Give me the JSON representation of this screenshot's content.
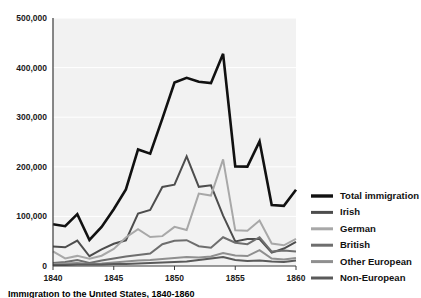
{
  "chart_data": {
    "type": "line",
    "title": "",
    "xlabel": "",
    "ylabel": "",
    "xlim": [
      1840,
      1860
    ],
    "ylim": [
      0,
      500000
    ],
    "grid": true,
    "legend_position": "right",
    "x": [
      1840,
      1841,
      1842,
      1843,
      1844,
      1845,
      1846,
      1847,
      1848,
      1849,
      1850,
      1851,
      1852,
      1853,
      1854,
      1855,
      1856,
      1857,
      1858,
      1859,
      1860
    ],
    "xticks": [
      "1840",
      "1845",
      "1850",
      "1855",
      "1860"
    ],
    "xtick_values": [
      1840,
      1845,
      1850,
      1855,
      1860
    ],
    "yticks": [
      "0",
      "100,000",
      "200,000",
      "300,000",
      "400,000",
      "500,000"
    ],
    "ytick_values": [
      0,
      100000,
      200000,
      300000,
      400000,
      500000
    ],
    "series": [
      {
        "name": "Total immigration",
        "color": "#111111",
        "width": 2.6,
        "values": [
          84066,
          80289,
          104565,
          52496,
          78615,
          114371,
          154416,
          234968,
          226527,
          297024,
          369980,
          379466,
          371603,
          368645,
          427833,
          200877,
          200436,
          251306,
          123126,
          121282,
          153640
        ]
      },
      {
        "name": "Irish",
        "color": "#4d4d4d",
        "width": 2.0,
        "values": [
          39430,
          37772,
          51342,
          19670,
          33490,
          44821,
          51752,
          105536,
          112934,
          159398,
          164004,
          221253,
          159548,
          162649,
          101606,
          49627,
          54349,
          54361,
          26873,
          35216,
          48637
        ]
      },
      {
        "name": "German",
        "color": "#a8a8a8",
        "width": 2.0,
        "values": [
          29704,
          15291,
          20370,
          14441,
          20731,
          34355,
          57561,
          74281,
          58465,
          60235,
          78896,
          72482,
          145918,
          141946,
          215009,
          71918,
          71028,
          91781,
          45310,
          41784,
          54491
        ]
      },
      {
        "name": "British",
        "color": "#6e6e6e",
        "width": 2.0,
        "values": [
          6000,
          8000,
          12000,
          6000,
          11000,
          15000,
          19000,
          22000,
          25000,
          44000,
          51000,
          52000,
          40000,
          37000,
          58000,
          47000,
          44000,
          58000,
          29000,
          31000,
          29000
        ]
      },
      {
        "name": "Other European",
        "color": "#8f8f8f",
        "width": 2.0,
        "values": [
          4000,
          5000,
          6000,
          4000,
          5000,
          7000,
          9000,
          11000,
          12000,
          14000,
          16000,
          18000,
          17000,
          19000,
          26000,
          21000,
          20000,
          32000,
          15000,
          13000,
          16000
        ]
      },
      {
        "name": "Non-European",
        "color": "#5a5a5a",
        "width": 2.0,
        "values": [
          2000,
          2000,
          3000,
          3000,
          3000,
          4000,
          4000,
          5000,
          6000,
          7000,
          8000,
          9000,
          12000,
          15000,
          18000,
          12000,
          10000,
          11000,
          9000,
          8000,
          11000
        ]
      }
    ]
  },
  "legend": {
    "items": [
      {
        "label": "Total immigration",
        "color": "#111111",
        "width": 3.4
      },
      {
        "label": "Irish",
        "color": "#4d4d4d",
        "width": 3.0
      },
      {
        "label": "German",
        "color": "#a8a8a8",
        "width": 3.0
      },
      {
        "label": "British",
        "color": "#6e6e6e",
        "width": 3.0
      },
      {
        "label": "Other European",
        "color": "#8f8f8f",
        "width": 3.0
      },
      {
        "label": "Non-European",
        "color": "#5a5a5a",
        "width": 3.0
      }
    ]
  },
  "caption": {
    "text": "Immigration to the United States, 1840-1860"
  },
  "colors": {
    "plot_background": "#f2f2f2",
    "gridline": "#ffffff",
    "axis": "#3a3a3a",
    "text": "#1a1a1a"
  }
}
